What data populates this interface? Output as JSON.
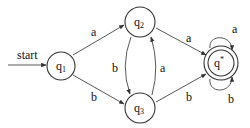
{
  "diagram": {
    "type": "dfa",
    "start_label": "start",
    "states": [
      {
        "id": "q1",
        "base": "q",
        "sub": "1",
        "accepting": false,
        "start": true
      },
      {
        "id": "q2",
        "base": "q",
        "sub": "2",
        "accepting": false
      },
      {
        "id": "q3",
        "base": "q",
        "sub": "3",
        "accepting": false
      },
      {
        "id": "qstar",
        "base": "q",
        "sup": "*",
        "accepting": true
      }
    ],
    "transitions": [
      {
        "from": "q1",
        "to": "q2",
        "label": "a"
      },
      {
        "from": "q1",
        "to": "q3",
        "label": "b"
      },
      {
        "from": "q2",
        "to": "q3",
        "label": "b"
      },
      {
        "from": "q3",
        "to": "q2",
        "label": "a"
      },
      {
        "from": "q2",
        "to": "qstar",
        "label": "a"
      },
      {
        "from": "q3",
        "to": "qstar",
        "label": "b"
      },
      {
        "from": "qstar",
        "to": "qstar",
        "label": "a"
      },
      {
        "from": "qstar",
        "to": "qstar",
        "label": "b"
      }
    ],
    "labels": {
      "start": "start",
      "q1_base": "q",
      "q1_sub": "1",
      "q2_base": "q",
      "q2_sub": "2",
      "q3_base": "q",
      "q3_sub": "3",
      "qstar_base": "q",
      "qstar_sup": "*",
      "e_q1_q2": "a",
      "e_q1_q3": "b",
      "e_q2_q3": "b",
      "e_q3_q2": "a",
      "e_q2_qstar": "a",
      "e_q3_qstar": "b",
      "loop_top": "a",
      "loop_bottom": "b"
    },
    "colors": {
      "stroke": "#333333",
      "background": "#ffffff"
    }
  }
}
